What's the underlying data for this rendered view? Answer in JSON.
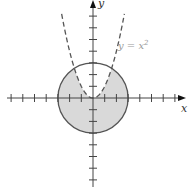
{
  "chart_data": {
    "type": "line",
    "title": "",
    "xlabel": "x",
    "ylabel": "y",
    "xlim": [
      -7.5,
      7.5
    ],
    "ylim": [
      -7.5,
      8
    ],
    "x_ticks": [
      -7,
      -6,
      -5,
      -4,
      -3,
      -2,
      -1,
      1,
      2,
      3,
      4,
      5,
      6,
      7
    ],
    "y_ticks": [
      -7,
      -6,
      -5,
      -4,
      -3,
      -2,
      -1,
      1,
      2,
      3,
      4,
      5,
      6,
      7
    ],
    "tick_labels_shown": false,
    "grid": false,
    "series": [
      {
        "name": "y = x^2",
        "style": "dashed",
        "color": "#555555",
        "equation": "y = x^2",
        "x_range": [
          -2.68,
          2.68
        ]
      },
      {
        "name": "circle",
        "style": "solid",
        "color": "#555555",
        "equation": "x^2 + y^2 = 9",
        "radius": 3,
        "center": [
          0,
          0
        ]
      }
    ],
    "shaded_region": {
      "description": "inside circle x^2 + y^2 <= 9 and below parabola y <= x^2",
      "fill": "#d9d9d9"
    },
    "annotations": [
      {
        "text": "y = x²",
        "x": 2.0,
        "y": 4.3
      }
    ]
  },
  "labels": {
    "x_axis": "x",
    "y_axis": "y",
    "parabola_label_y": "y",
    "parabola_label_eq": " = x",
    "parabola_label_exp": "2"
  }
}
